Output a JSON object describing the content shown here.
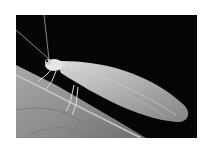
{
  "image": {
    "subject": "Green lacewing insect resting on a leaf edge",
    "alt": "Grayscale photograph of a lacewing with long antennae and translucent veined wings perched on a leaf against a black background"
  },
  "colors": {
    "background": "#ffffff",
    "photo_background": "#050505",
    "leaf": "#8f8f8f",
    "insect": "#e6e6e6"
  }
}
